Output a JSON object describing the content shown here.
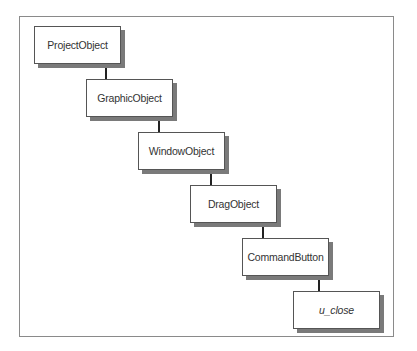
{
  "diagram": {
    "type": "inheritance-hierarchy",
    "nodes": [
      {
        "label": "ProjectObject",
        "italic": false
      },
      {
        "label": "GraphicObject",
        "italic": false
      },
      {
        "label": "WindowObject",
        "italic": false
      },
      {
        "label": "DragObject",
        "italic": false
      },
      {
        "label": "CommandButton",
        "italic": false
      },
      {
        "label": "u_close",
        "italic": true
      }
    ],
    "edges": [
      {
        "from": "ProjectObject",
        "to": "GraphicObject"
      },
      {
        "from": "GraphicObject",
        "to": "WindowObject"
      },
      {
        "from": "WindowObject",
        "to": "DragObject"
      },
      {
        "from": "DragObject",
        "to": "CommandButton"
      },
      {
        "from": "CommandButton",
        "to": "u_close"
      }
    ],
    "colors": {
      "border": "#555555",
      "shadow": "#7a7a7a",
      "frame": "#8a8a8a",
      "text": "#333333"
    }
  }
}
